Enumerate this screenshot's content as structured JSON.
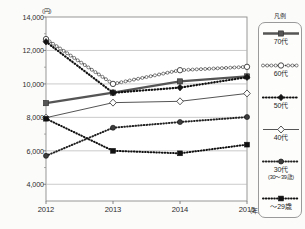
{
  "chart_data": {
    "type": "line",
    "title": "",
    "xlabel": "年",
    "ylabel": "円",
    "y_unit_label": "(円)",
    "x_unit_label": "(年)",
    "categories": [
      "2012",
      "2013",
      "2014",
      "2015"
    ],
    "x": [
      2012,
      2013,
      2014,
      2015
    ],
    "ylim": [
      3000,
      14000
    ],
    "yticks": [
      4000,
      6000,
      8000,
      10000,
      12000,
      14000
    ],
    "ytick_labels": [
      "4,000",
      "6,000",
      "8,000",
      "10,000",
      "12,000",
      "14,000"
    ],
    "grid": true,
    "legend_position": "right",
    "legend_title": "凡例",
    "series": [
      {
        "name": "70代",
        "label": "70代",
        "sublabel": "",
        "values": [
          8850,
          9480,
          10150,
          10450
        ],
        "color": "#555555",
        "marker": "square-filled",
        "line_style": "solid-thick"
      },
      {
        "name": "60代",
        "label": "60代",
        "sublabel": "",
        "values": [
          12680,
          10000,
          10820,
          11020
        ],
        "color": "#3a3a3a",
        "marker": "circle-open",
        "line_style": "dotted-circles"
      },
      {
        "name": "50代",
        "label": "50代",
        "sublabel": "",
        "values": [
          12520,
          9470,
          9780,
          10400
        ],
        "color": "#111111",
        "marker": "diamond-filled",
        "line_style": "dotted-thick"
      },
      {
        "name": "40代",
        "label": "40代",
        "sublabel": "",
        "values": [
          7980,
          8880,
          8960,
          9430
        ],
        "color": "#555555",
        "marker": "diamond-open",
        "line_style": "solid-thin"
      },
      {
        "name": "30代",
        "label": "30代",
        "sublabel": "(30〜39歳)",
        "values": [
          5700,
          7380,
          7720,
          8020
        ],
        "color": "#222222",
        "marker": "circle-filled",
        "line_style": "dotted-dense"
      },
      {
        "name": "〜29歳",
        "label": "〜29歳",
        "sublabel": "",
        "values": [
          7920,
          6000,
          5850,
          6370
        ],
        "color": "#111111",
        "marker": "square-filled-sm",
        "line_style": "dotted-dense"
      }
    ]
  }
}
